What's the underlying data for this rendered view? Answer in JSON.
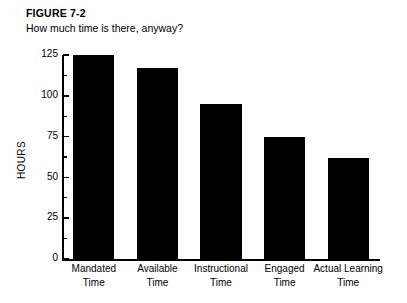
{
  "figure": {
    "number": "FIGURE 7-2",
    "subtitle": "How much time is there, anyway?"
  },
  "chart_data": {
    "type": "bar",
    "title": "FIGURE 7-2",
    "subtitle": "How much time is there, anyway?",
    "xlabel": "",
    "ylabel": "HOURS",
    "categories": [
      "Mandated Time",
      "Available Time",
      "Instructional Time",
      "Engaged Time",
      "Actual Learning Time"
    ],
    "category_lines": [
      [
        "Mandated",
        "Time"
      ],
      [
        "Available",
        "Time"
      ],
      [
        "Instructional",
        "Time"
      ],
      [
        "Engaged",
        "Time"
      ],
      [
        "Actual Learning",
        "Time"
      ]
    ],
    "values": [
      125,
      117,
      95,
      75,
      62
    ],
    "ylim": [
      0,
      125
    ],
    "ytick_labels": [
      "0",
      "25",
      "50",
      "75",
      "100",
      "125"
    ],
    "ytick_values": [
      0,
      25,
      50,
      75,
      100,
      125
    ],
    "yminor_tick_values": [
      12.5,
      37.5,
      62.5,
      87.5,
      112.5
    ],
    "grid": false,
    "legend": false,
    "bar_color": "#000000",
    "background_color": "#ffffff"
  }
}
